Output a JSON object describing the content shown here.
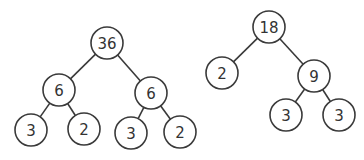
{
  "diagram": {
    "title": "",
    "trees": [
      {
        "name": "factor-tree-36",
        "nodes": [
          {
            "id": "a",
            "label": "36",
            "x": 107,
            "y": 43
          },
          {
            "id": "b",
            "label": "6",
            "x": 59,
            "y": 90
          },
          {
            "id": "c",
            "label": "6",
            "x": 151,
            "y": 93
          },
          {
            "id": "d",
            "label": "3",
            "x": 31,
            "y": 130
          },
          {
            "id": "e",
            "label": "2",
            "x": 84,
            "y": 129
          },
          {
            "id": "f",
            "label": "3",
            "x": 131,
            "y": 133
          },
          {
            "id": "g",
            "label": "2",
            "x": 180,
            "y": 132
          }
        ],
        "edges": [
          [
            "a",
            "b"
          ],
          [
            "a",
            "c"
          ],
          [
            "b",
            "d"
          ],
          [
            "b",
            "e"
          ],
          [
            "c",
            "f"
          ],
          [
            "c",
            "g"
          ]
        ]
      },
      {
        "name": "factor-tree-18",
        "nodes": [
          {
            "id": "h",
            "label": "18",
            "x": 269,
            "y": 27
          },
          {
            "id": "i",
            "label": "2",
            "x": 222,
            "y": 73
          },
          {
            "id": "j",
            "label": "9",
            "x": 314,
            "y": 76
          },
          {
            "id": "k",
            "label": "3",
            "x": 286,
            "y": 115
          },
          {
            "id": "l",
            "label": "3",
            "x": 339,
            "y": 115
          }
        ],
        "edges": [
          [
            "h",
            "i"
          ],
          [
            "h",
            "j"
          ],
          [
            "j",
            "k"
          ],
          [
            "j",
            "l"
          ]
        ]
      }
    ],
    "node_radius": 16,
    "colors": {
      "stroke": "#3a3a3a",
      "text": "#333333",
      "fill": "#ffffff",
      "background": "#ffffff"
    }
  }
}
